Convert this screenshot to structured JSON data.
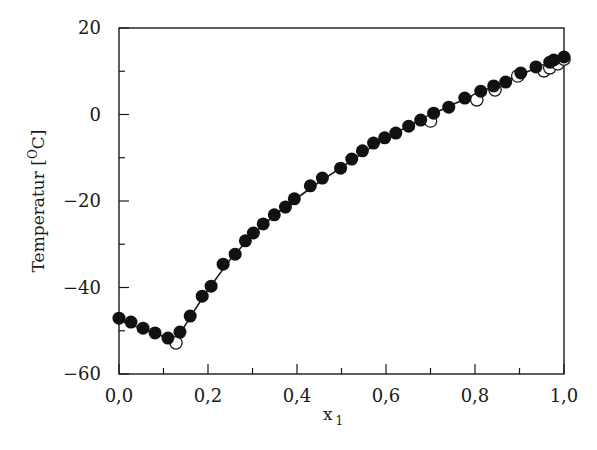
{
  "chart_data": {
    "type": "scatter",
    "title": "",
    "xlabel": "x",
    "xlabel_subscript": "1",
    "ylabel": "Temperatur [",
    "ylabel_unit_sup": "O",
    "ylabel_unit": "C]",
    "xlim": [
      0.0,
      1.0
    ],
    "ylim": [
      -60,
      20
    ],
    "grid": false,
    "x_ticks": [
      "0,0",
      "0,2",
      "0,4",
      "0,6",
      "0,8",
      "1,0"
    ],
    "y_ticks": [
      "20",
      "0",
      "-20",
      "-40",
      "-60"
    ],
    "series": [
      {
        "name": "filled",
        "marker": "filled-circle",
        "points": [
          [
            0.0,
            -47.1
          ],
          [
            0.027,
            -48.0
          ],
          [
            0.054,
            -49.4
          ],
          [
            0.081,
            -50.5
          ],
          [
            0.11,
            -51.7
          ],
          [
            0.137,
            -50.3
          ],
          [
            0.16,
            -46.6
          ],
          [
            0.187,
            -42.0
          ],
          [
            0.207,
            -39.7
          ],
          [
            0.234,
            -34.6
          ],
          [
            0.261,
            -32.3
          ],
          [
            0.284,
            -29.2
          ],
          [
            0.302,
            -27.4
          ],
          [
            0.324,
            -25.3
          ],
          [
            0.349,
            -23.2
          ],
          [
            0.374,
            -21.4
          ],
          [
            0.394,
            -19.5
          ],
          [
            0.43,
            -16.5
          ],
          [
            0.457,
            -14.7
          ],
          [
            0.498,
            -12.4
          ],
          [
            0.523,
            -10.3
          ],
          [
            0.547,
            -8.4
          ],
          [
            0.572,
            -6.6
          ],
          [
            0.597,
            -5.4
          ],
          [
            0.622,
            -4.3
          ],
          [
            0.651,
            -2.7
          ],
          [
            0.678,
            -1.3
          ],
          [
            0.707,
            0.3
          ],
          [
            0.741,
            1.7
          ],
          [
            0.777,
            3.8
          ],
          [
            0.813,
            5.4
          ],
          [
            0.842,
            6.6
          ],
          [
            0.869,
            7.5
          ],
          [
            0.903,
            9.6
          ],
          [
            0.937,
            11.0
          ],
          [
            0.968,
            12.1
          ],
          [
            0.977,
            12.6
          ],
          [
            1.0,
            13.3
          ]
        ]
      },
      {
        "name": "open",
        "marker": "open-circle",
        "points": [
          [
            0.128,
            -52.8
          ],
          [
            0.7,
            -1.5
          ],
          [
            0.804,
            3.4
          ],
          [
            0.845,
            5.7
          ],
          [
            0.896,
            8.9
          ],
          [
            0.955,
            10.1
          ],
          [
            0.968,
            10.8
          ],
          [
            0.986,
            11.7
          ],
          [
            1.0,
            12.8
          ]
        ]
      }
    ],
    "curve": {
      "name": "fit-line",
      "points": [
        [
          0.0,
          -47.5
        ],
        [
          0.05,
          -49.5
        ],
        [
          0.1,
          -51.3
        ],
        [
          0.13,
          -52.0
        ],
        [
          0.16,
          -46.8
        ],
        [
          0.2,
          -40.5
        ],
        [
          0.25,
          -33.5
        ],
        [
          0.3,
          -27.8
        ],
        [
          0.35,
          -23.2
        ],
        [
          0.4,
          -19.3
        ],
        [
          0.45,
          -15.6
        ],
        [
          0.5,
          -12.2
        ],
        [
          0.55,
          -8.7
        ],
        [
          0.6,
          -5.4
        ],
        [
          0.65,
          -2.7
        ],
        [
          0.7,
          -0.1
        ],
        [
          0.75,
          2.3
        ],
        [
          0.8,
          4.6
        ],
        [
          0.85,
          6.9
        ],
        [
          0.9,
          9.2
        ],
        [
          0.95,
          11.2
        ],
        [
          1.0,
          13.0
        ]
      ]
    }
  }
}
